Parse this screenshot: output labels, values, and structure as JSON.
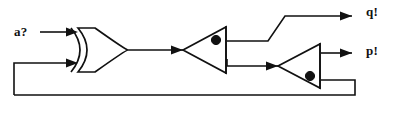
{
  "figure": {
    "name": "sequential-logic-circuit",
    "type": "digital-logic-schematic",
    "width": 394,
    "height": 126,
    "background_color": "#ffffff",
    "line_color": "#111111"
  },
  "labels": {
    "input_a": "a?",
    "output_q": "q!",
    "output_p": "p!"
  },
  "gates": [
    {
      "id": "xor-gate",
      "name": "xor-gate",
      "type": "XOR",
      "inputs": 2,
      "has_bubble": false,
      "orientation": "right",
      "x": 62,
      "y": 50
    },
    {
      "id": "inverter-1",
      "name": "inverter-gate-1",
      "type": "NOT",
      "inputs": 1,
      "has_bubble": true,
      "orientation": "right",
      "x": 190,
      "y": 50
    },
    {
      "id": "inverter-2",
      "name": "inverter-gate-2",
      "type": "NOT",
      "inputs": 1,
      "has_bubble": true,
      "orientation": "right",
      "x": 285,
      "y": 66
    }
  ],
  "nets": [
    {
      "name": "input-a-wire",
      "from": "input_a",
      "to": "xor-gate.in1"
    },
    {
      "name": "feedback-wire",
      "from": "inverter-2.out",
      "to": "xor-gate.in2"
    },
    {
      "name": "xor-to-inverter1",
      "from": "xor-gate.out",
      "to": "inverter-1.in"
    },
    {
      "name": "inverter1-to-q",
      "from": "inverter-1.out",
      "to": "output_q"
    },
    {
      "name": "inverter1-to-inverter2",
      "from": "inverter-1.out",
      "to": "inverter-2.in"
    },
    {
      "name": "inverter2-to-p",
      "from": "inverter-2.out",
      "to": "output_p"
    }
  ]
}
